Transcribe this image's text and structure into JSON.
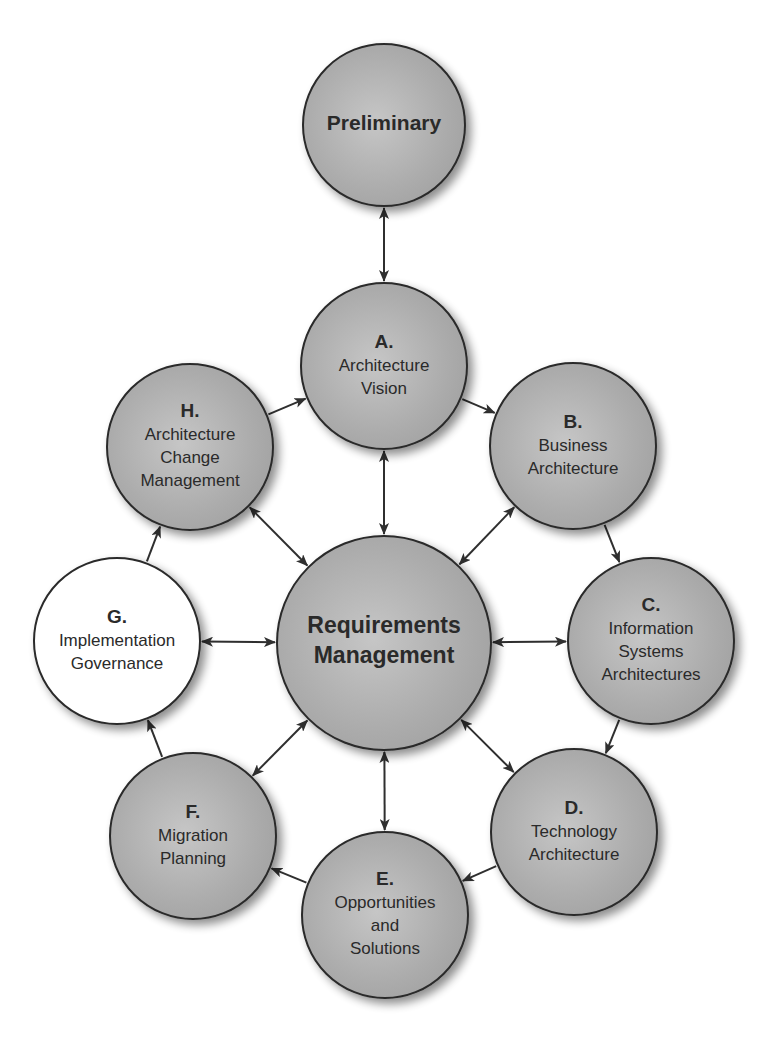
{
  "diagram": {
    "type": "TOGAF ADM cycle",
    "colors": {
      "node_fill": "#a9a9a9",
      "node_fill_highlight": "#c4c4c4",
      "highlighted_node_fill": "#ffffff",
      "stroke": "#2a2a2a",
      "arrow": "#2f2f2f",
      "background": "#ffffff"
    },
    "nodes": {
      "preliminary": {
        "letter": "",
        "lines": [
          "Preliminary"
        ],
        "cx": 384,
        "cy": 125,
        "r": 81,
        "highlighted": false
      },
      "a": {
        "letter": "A.",
        "lines": [
          "Architecture",
          "Vision"
        ],
        "cx": 384,
        "cy": 366,
        "r": 83,
        "highlighted": false
      },
      "b": {
        "letter": "B.",
        "lines": [
          "Business",
          "Architecture"
        ],
        "cx": 573,
        "cy": 446,
        "r": 83,
        "highlighted": false
      },
      "c": {
        "letter": "C.",
        "lines": [
          "Information",
          "Systems",
          "Architectures"
        ],
        "cx": 651,
        "cy": 641,
        "r": 83,
        "highlighted": false
      },
      "d": {
        "letter": "D.",
        "lines": [
          "Technology",
          "Architecture"
        ],
        "cx": 574,
        "cy": 832,
        "r": 83,
        "highlighted": false
      },
      "e": {
        "letter": "E.",
        "lines": [
          "Opportunities",
          "and",
          "Solutions"
        ],
        "cx": 385,
        "cy": 915,
        "r": 83,
        "highlighted": false
      },
      "f": {
        "letter": "F.",
        "lines": [
          "Migration",
          "Planning"
        ],
        "cx": 193,
        "cy": 836,
        "r": 83,
        "highlighted": false
      },
      "g": {
        "letter": "G.",
        "lines": [
          "Implementation",
          "Governance"
        ],
        "cx": 117,
        "cy": 641,
        "r": 83,
        "highlighted": true
      },
      "h": {
        "letter": "H.",
        "lines": [
          "Architecture",
          "Change",
          "Management"
        ],
        "cx": 190,
        "cy": 447,
        "r": 83,
        "highlighted": false
      },
      "center": {
        "letter": "",
        "lines": [
          "Requirements",
          "Management"
        ],
        "cx": 384,
        "cy": 643,
        "r": 107,
        "highlighted": false
      }
    },
    "edges": [
      {
        "from": "preliminary",
        "to": "a",
        "bidirectional": true
      },
      {
        "from": "a",
        "to": "b",
        "bidirectional": false
      },
      {
        "from": "b",
        "to": "c",
        "bidirectional": false
      },
      {
        "from": "c",
        "to": "d",
        "bidirectional": false
      },
      {
        "from": "d",
        "to": "e",
        "bidirectional": false
      },
      {
        "from": "e",
        "to": "f",
        "bidirectional": false
      },
      {
        "from": "f",
        "to": "g",
        "bidirectional": false
      },
      {
        "from": "g",
        "to": "h",
        "bidirectional": false
      },
      {
        "from": "h",
        "to": "a",
        "bidirectional": false
      },
      {
        "from": "center",
        "to": "a",
        "bidirectional": true
      },
      {
        "from": "center",
        "to": "b",
        "bidirectional": true
      },
      {
        "from": "center",
        "to": "c",
        "bidirectional": true
      },
      {
        "from": "center",
        "to": "d",
        "bidirectional": true
      },
      {
        "from": "center",
        "to": "e",
        "bidirectional": true
      },
      {
        "from": "center",
        "to": "f",
        "bidirectional": true
      },
      {
        "from": "center",
        "to": "g",
        "bidirectional": true
      },
      {
        "from": "center",
        "to": "h",
        "bidirectional": true
      }
    ]
  }
}
